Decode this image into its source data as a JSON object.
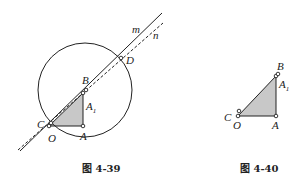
{
  "figures": [
    {
      "caption": "图 4-39",
      "labels": {
        "m": "m",
        "n": "n",
        "D": "D",
        "B": "B",
        "A1": "A",
        "A1_sub": "1",
        "C": "C",
        "O": "O",
        "A": "A"
      }
    },
    {
      "caption": "图 4-40",
      "labels": {
        "B": "B",
        "A1": "A",
        "A1_sub": "1",
        "C": "C",
        "O": "O",
        "A": "A"
      }
    }
  ],
  "colors": {
    "stroke": "#222222",
    "fill": "#c8c8c8",
    "background": "#ffffff"
  }
}
